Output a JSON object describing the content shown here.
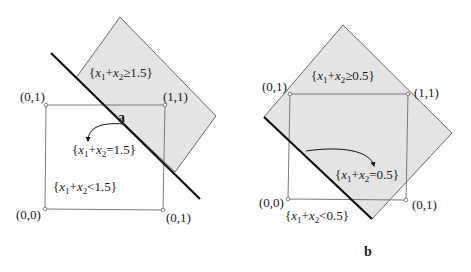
{
  "figure": {
    "panels": [
      {
        "id": "a",
        "caption": "a",
        "threshold": "1.5",
        "vertices": {
          "top_left": "(0,1)",
          "top_right": "(1,1)",
          "bottom_left": "(0,0)",
          "bottom_right": "(0,1)"
        },
        "regions": {
          "ge": {
            "lhs_var1": "x",
            "sub1": "1",
            "plus": "+",
            "lhs_var2": "x",
            "sub2": "2",
            "op": "≥",
            "rhs": "1.5",
            "open": "{",
            "close": "}"
          },
          "eq": {
            "lhs_var1": "x",
            "sub1": "1",
            "plus": "+",
            "lhs_var2": "x",
            "sub2": "2",
            "op": "=",
            "rhs": "1.5",
            "open": "{",
            "close": "}"
          },
          "lt": {
            "lhs_var1": "x",
            "sub1": "1",
            "plus": "+",
            "lhs_var2": "x",
            "sub2": "2",
            "op": "<",
            "rhs": "1.5",
            "open": "{",
            "close": "}"
          }
        }
      },
      {
        "id": "b",
        "caption": "b",
        "threshold": "0.5",
        "vertices": {
          "top_left": "(0,1)",
          "top_right": "(1,1)",
          "bottom_left": "(0,0)",
          "bottom_right": "(0,1)"
        },
        "regions": {
          "ge": {
            "lhs_var1": "x",
            "sub1": "1",
            "plus": "+",
            "lhs_var2": "x",
            "sub2": "2",
            "op": "≥",
            "rhs": "0.5",
            "open": "{",
            "close": "}"
          },
          "eq": {
            "lhs_var1": "x",
            "sub1": "1",
            "plus": "+",
            "lhs_var2": "x",
            "sub2": "2",
            "op": "=",
            "rhs": "0.5",
            "open": "{",
            "close": "}"
          },
          "lt": {
            "lhs_var1": "x",
            "sub1": "1",
            "plus": "+",
            "lhs_var2": "x",
            "sub2": "2",
            "op": "<",
            "rhs": "0.5",
            "open": "{",
            "close": "}"
          }
        }
      }
    ],
    "colors": {
      "half_plane_fill": "#e4e4e4",
      "half_plane_edge": "#6a6a6a",
      "square_edge": "#7a7a7a",
      "boundary_line": "#111111",
      "text": "#1a1a1a"
    }
  }
}
